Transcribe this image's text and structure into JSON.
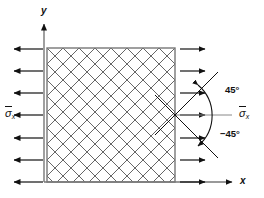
{
  "figure": {
    "background_color": "#ffffff",
    "line_color": "#111111",
    "hatch_color": "#555555"
  },
  "axes": {
    "y_label": "y",
    "x_label": "x",
    "origin": {
      "x": 44,
      "y": 182
    }
  },
  "element": {
    "shape": "square",
    "left": 47,
    "top": 48,
    "right": 175,
    "bottom": 182,
    "hatch_pattern": "cross-hatch-45",
    "hatch_spacing_px": 16
  },
  "loads": {
    "left_label": "σ̄x",
    "right_label": "σ̄x",
    "left_label_sigma": "σ",
    "left_label_sub": "x",
    "right_label_sigma": "σ",
    "right_label_sub": "x",
    "left_arrow_count": 7,
    "right_arrow_count": 7,
    "left_arrow_direction": "left",
    "right_arrow_direction": "right",
    "arrow_rows_y": [
      49,
      71,
      93,
      115,
      138,
      160,
      182
    ]
  },
  "angles": {
    "upper": "45°",
    "lower": "−45°",
    "vertex": {
      "x": 175,
      "y": 115
    },
    "upper_ray_end": {
      "x": 216,
      "y": 73
    },
    "lower_ray_end": {
      "x": 216,
      "y": 157
    },
    "arc_radius": 48
  }
}
